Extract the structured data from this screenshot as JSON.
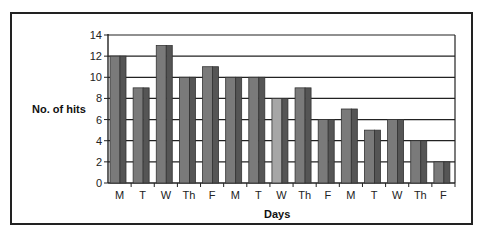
{
  "chart_data": {
    "type": "bar",
    "title": "",
    "xlabel": "Days",
    "ylabel": "No. of hits",
    "categories": [
      "M",
      "T",
      "W",
      "Th",
      "F",
      "M",
      "T",
      "W",
      "Th",
      "F",
      "M",
      "T",
      "W",
      "Th",
      "F"
    ],
    "values": [
      12,
      9,
      13,
      10,
      11,
      10,
      10,
      8,
      9,
      6,
      7,
      5,
      6,
      4,
      2
    ],
    "ylim": [
      0,
      14
    ],
    "yticks": [
      0,
      2,
      4,
      6,
      8,
      10,
      12,
      14
    ],
    "grid": true,
    "legend": null,
    "style": "3d-column",
    "colors": {
      "bar_front": "#7a7a7a",
      "bar_side": "#555555",
      "bar_front_highlight": "#a6a6a6",
      "grid": "#222222",
      "frame": "#222222"
    },
    "highlight_index": 7
  }
}
